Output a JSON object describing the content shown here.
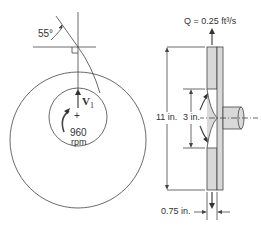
{
  "front_view": {
    "angle_label": "55°",
    "velocity_label": "V",
    "velocity_subscript": "1",
    "speed_value": "960",
    "speed_unit": "rpm",
    "center_mark": "+"
  },
  "side_view": {
    "flow_label": "Q = 0.25 ft³/s",
    "outer_diameter_label": "11 in.",
    "inner_diameter_label": "3 in.",
    "width_label": "0.75 in."
  },
  "colors": {
    "line": "#444444",
    "fill": "#d9d9d9"
  }
}
